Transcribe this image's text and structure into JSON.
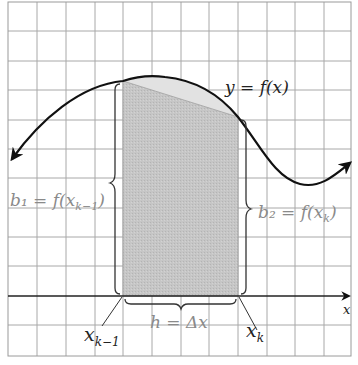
{
  "figure": {
    "curve_label": "y = f(x)",
    "left_base_label": "b₁ = f(x",
    "left_base_sub": "k−1",
    "right_base_label": "b₂ = f(x",
    "right_base_sub": "k",
    "height_label": "h = Δx",
    "x_left_label": "x",
    "x_left_sub": "k−1",
    "x_right_label": "x",
    "x_right_sub": "k",
    "x_axis_label": "x"
  },
  "colors": {
    "grid": "#a8a8a8",
    "grid_border": "#9a9a9a",
    "curve": "#111111",
    "trapezoid_fill": "#c4c4c4",
    "cap_fill": "#e2e2e2",
    "brace": "#333333",
    "label_gray": "#8a8a8a",
    "label_dark": "#222222"
  }
}
